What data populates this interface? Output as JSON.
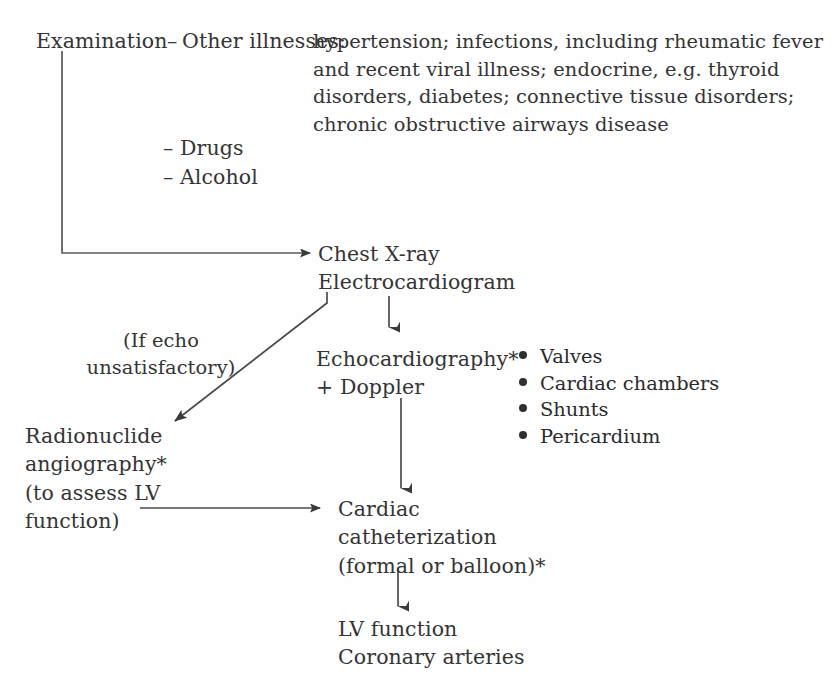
{
  "diagram": {
    "line_color": "#4a4a4a",
    "text_color": "#343434",
    "background": "#fefefe"
  },
  "nodes": {
    "examination": "Examination",
    "dash_other": "–",
    "other_illnesses_label": "Other illnesses:",
    "other_illnesses_body": "hypertension; infections, including rheumatic fever and recent viral illness; endocrine, e.g. thyroid disorders, diabetes; connective tissue disorders; chronic obstructive airways disease",
    "drugs_alcohol": "– Drugs\n– Alcohol",
    "chest_ecg": "Chest X-ray\nElectrocardiogram",
    "if_echo_note": "(If echo\nunsatisfactory)",
    "echocardiography": "Echocardiography*\n+ Doppler",
    "radionuclide": "Radionuclide\nangiography*\n(to assess LV\nfunction)",
    "cardiac_catheterization": "Cardiac\ncatheterization\n(formal or balloon)*",
    "outcomes": "LV function\nCoronary arteries"
  },
  "echo_findings": [
    "Valves",
    "Cardiac chambers",
    "Shunts",
    "Pericardium"
  ],
  "connectors": [
    {
      "name": "examination-to-chest-xray",
      "from": "Examination",
      "to": "Chest X-ray",
      "shape": "elbow-down-right",
      "arrowhead": true
    },
    {
      "name": "ecg-to-echocardiography",
      "from": "Electrocardiogram",
      "to": "Echocardiography*",
      "shape": "vertical-down",
      "arrowhead": true
    },
    {
      "name": "ecg-to-radionuclide",
      "from": "Electrocardiogram",
      "to": "Radionuclide angiography*",
      "shape": "diagonal-down-left",
      "arrowhead": true
    },
    {
      "name": "echocardiography-to-cardiac-catheterization",
      "from": "Echocardiography*",
      "to": "Cardiac catheterization",
      "shape": "vertical-down",
      "arrowhead": true
    },
    {
      "name": "radionuclide-to-cardiac-catheterization",
      "from": "Radionuclide angiography*",
      "to": "Cardiac catheterization",
      "shape": "horizontal-right",
      "arrowhead": true
    },
    {
      "name": "cardiac-catheterization-to-outcomes",
      "from": "Cardiac catheterization",
      "to": "LV function",
      "shape": "vertical-down",
      "arrowhead": true
    }
  ]
}
